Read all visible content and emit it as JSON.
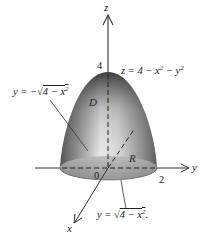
{
  "figure": {
    "axes": {
      "x_label": "x",
      "y_label": "y",
      "z_label": "z"
    },
    "tick_labels": {
      "origin": "0",
      "y_intercept": "2",
      "z_intercept": "4"
    },
    "region_labels": {
      "solid": "D",
      "base": "R"
    },
    "equations": {
      "surface": {
        "lhs": "z = 4 − x",
        "mid": " − y",
        "exp1": "2",
        "exp2": "2"
      },
      "left_boundary": {
        "lhs": "y = −",
        "radicand": "4 − x",
        "exp": "2"
      },
      "right_boundary": {
        "lhs": "y = ",
        "radicand": "4 − x",
        "exp": "2",
        "trail": "."
      }
    },
    "colors": {
      "surface_dark": "#3a3a3a",
      "surface_light": "#e8e8e8",
      "line": "#333333"
    }
  }
}
